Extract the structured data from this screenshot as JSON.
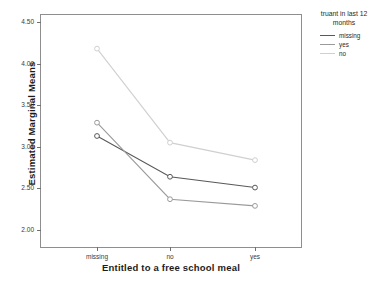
{
  "chart_data": {
    "type": "line",
    "title": "",
    "subtitle": "",
    "xlabel": "Entitled to a free school meal",
    "ylabel": "Estimated Marginal Means",
    "categories": [
      "missing",
      "no",
      "yes"
    ],
    "ylim": [
      2.0,
      4.5
    ],
    "yticks": [
      "2.00",
      "2.50",
      "3.00",
      "3.50",
      "4.00",
      "4.50"
    ],
    "ytick_values": [
      2.0,
      2.5,
      3.0,
      3.5,
      4.0,
      4.5
    ],
    "grid": false,
    "legend_position": "right",
    "legend_title": "truant in last 12 months",
    "marker": "circle-open",
    "series": [
      {
        "name": "missing",
        "values": [
          3.13,
          2.64,
          2.51
        ],
        "color": "#595959"
      },
      {
        "name": "yes",
        "values": [
          3.29,
          2.37,
          2.29
        ],
        "color": "#9a9a9a"
      },
      {
        "name": "no",
        "values": [
          4.18,
          3.05,
          2.84
        ],
        "color": "#d0d0d0"
      }
    ]
  },
  "axes": {
    "y_title": "Estimated Marginal Means",
    "x_title": "Entitled to a free school meal",
    "y_tick_labels": [
      "4.50",
      "4.00",
      "3.50",
      "3.00",
      "2.50",
      "2.00"
    ],
    "x_tick_labels": [
      "missing",
      "no",
      "yes"
    ]
  },
  "legend": {
    "title_line1": "truant in last 12",
    "title_line2": "months",
    "entries": [
      {
        "label": "missing",
        "color": "#595959"
      },
      {
        "label": "yes",
        "color": "#9a9a9a"
      },
      {
        "label": "no",
        "color": "#d0d0d0"
      }
    ]
  },
  "colors": {
    "frame": "#8e8e8e",
    "text": "#2a2a2a",
    "background": "#ffffff"
  }
}
